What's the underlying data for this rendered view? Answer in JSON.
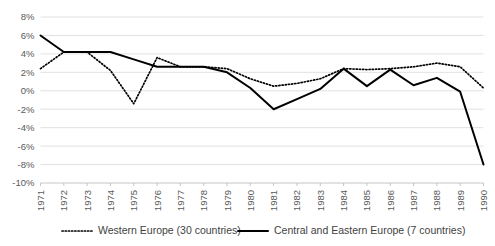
{
  "chart_data": {
    "type": "line",
    "title": "",
    "xlabel": "",
    "ylabel": "",
    "grid": true,
    "legend_position": "bottom",
    "ylim": [
      -10,
      8
    ],
    "ytick_labels": [
      "8%",
      "6%",
      "4%",
      "2%",
      "0%",
      "-2%",
      "-4%",
      "-6%",
      "-8%",
      "-10%"
    ],
    "ytick_values": [
      8,
      6,
      4,
      2,
      0,
      -2,
      -4,
      -6,
      -8,
      -10
    ],
    "categories": [
      "1971",
      "1972",
      "1973",
      "1974",
      "1975",
      "1976",
      "1977",
      "1978",
      "1979",
      "1980",
      "1981",
      "1982",
      "1983",
      "1984",
      "1985",
      "1986",
      "1987",
      "1988",
      "1989",
      "1990"
    ],
    "series": [
      {
        "name": "Western Europe (30 countries)",
        "style": "dotted",
        "values": [
          2.4,
          4.2,
          4.2,
          2.2,
          -1.4,
          3.6,
          2.6,
          2.6,
          2.4,
          1.3,
          0.5,
          0.8,
          1.3,
          2.4,
          2.3,
          2.4,
          2.6,
          3.0,
          2.6,
          0.3
        ]
      },
      {
        "name": "Central and Eastern Europe (7 countries)",
        "style": "solid",
        "values": [
          6.0,
          4.2,
          4.2,
          4.2,
          3.4,
          2.6,
          2.6,
          2.6,
          2.0,
          0.3,
          -2.0,
          -0.9,
          0.2,
          2.4,
          0.5,
          2.3,
          0.6,
          1.4,
          -0.1,
          -8.0
        ]
      }
    ]
  },
  "legend": {
    "items": [
      {
        "label": "Western Europe (30 countries)",
        "style": "dotted"
      },
      {
        "label": "Central and Eastern Europe (7 countries)",
        "style": "solid"
      }
    ]
  }
}
